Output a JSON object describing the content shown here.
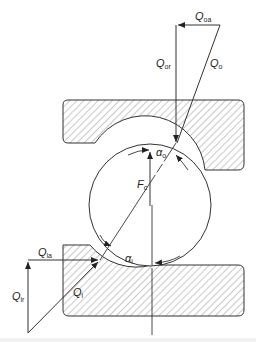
{
  "diagram": {
    "type": "ball bearing contact force diagram",
    "colors": {
      "line": "#333333",
      "hatch": "#777777",
      "background": "#ffffff"
    },
    "labels": {
      "Q_oa": {
        "main": "Q",
        "sub": "oa"
      },
      "Q_or": {
        "main": "Q",
        "sub": "or"
      },
      "Q_o": {
        "main": "Q",
        "sub": "o"
      },
      "alpha_o": {
        "main": "α",
        "sub": "o"
      },
      "F_c": {
        "main": "F",
        "sub": "c"
      },
      "Q_ia": {
        "main": "Q",
        "sub": "ia"
      },
      "alpha_i": {
        "main": "α",
        "sub": "i"
      },
      "Q_ir": {
        "main": "Q",
        "sub": "ir"
      },
      "Q_i": {
        "main": "Q",
        "sub": "i"
      }
    },
    "components": [
      "outer-ring",
      "ball",
      "inner-ring",
      "outer-force-triangle",
      "inner-force-triangle",
      "centrifugal-force-arrow"
    ]
  }
}
